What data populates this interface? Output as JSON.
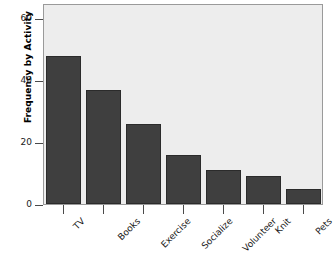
{
  "chart_data": {
    "type": "bar",
    "title": "",
    "xlabel": "",
    "ylabel": "Frequency by Activity",
    "categories": [
      "TV",
      "Books",
      "Exercise",
      "Socialize",
      "Volunteer",
      "Knit",
      "Pets"
    ],
    "values": [
      48,
      37,
      26,
      16,
      11,
      9,
      5
    ],
    "ylim": [
      0,
      65
    ],
    "y_ticks": [
      0,
      20,
      40,
      60
    ],
    "y_tick_labels": [
      "0",
      "20",
      "40",
      "60"
    ],
    "grid": false,
    "legend": "none",
    "bar_color": "#3f3f3f",
    "panel_color": "#ededed",
    "panel_border_color": "#9a9a9a",
    "axis_color": "#4a4a4a",
    "text_color": "#1a1a1a",
    "background_color": "#ffffff",
    "x_tick_label_rotation": -45
  }
}
